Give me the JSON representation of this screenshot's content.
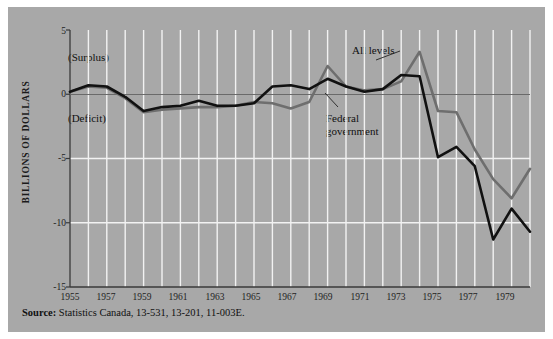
{
  "figure": {
    "background_color": "#a8a8a8",
    "page_color": "#ffffff",
    "source_prefix": "Source:",
    "source_text": "Statistics Canada, 13-531, 13-201, 11-003E."
  },
  "annotations": {
    "surplus": "(Surplus)",
    "deficit": "(Deficit)",
    "all_levels": "All levels",
    "federal_line1": "Federal",
    "federal_line2": "government"
  },
  "chart_data": {
    "type": "line",
    "title": "",
    "xlabel": "",
    "ylabel": "BILLIONS OF DOLLARS",
    "ylim": [
      -15,
      5
    ],
    "xlim": [
      1955,
      1980
    ],
    "yticks": [
      5,
      0,
      -5,
      -10,
      -15
    ],
    "ytick_labels": [
      "5",
      "0",
      "-5",
      "-10",
      "-15"
    ],
    "xticks": [
      1955,
      1957,
      1959,
      1961,
      1963,
      1965,
      1967,
      1969,
      1971,
      1973,
      1975,
      1977,
      1979
    ],
    "xtick_labels": [
      "1955",
      "1957",
      "1959",
      "1961",
      "1963",
      "1965",
      "1967",
      "1969",
      "1971",
      "1973",
      "1975",
      "1977",
      "1979"
    ],
    "grid": "vertical-every-year plus horizontal at -5 and -10",
    "zero_line": true,
    "legend_position": "inline-annotations",
    "x": [
      1955,
      1956,
      1957,
      1958,
      1959,
      1960,
      1961,
      1962,
      1963,
      1964,
      1965,
      1966,
      1967,
      1968,
      1969,
      1970,
      1971,
      1972,
      1973,
      1974,
      1975,
      1976,
      1977,
      1978,
      1979,
      1980
    ],
    "series": [
      {
        "name": "All levels",
        "color": "#6e6e6e",
        "values": [
          0.2,
          0.6,
          0.5,
          -0.3,
          -1.4,
          -1.2,
          -1.1,
          -1.0,
          -1.0,
          -0.9,
          -0.6,
          -0.7,
          -1.1,
          -0.6,
          2.2,
          0.6,
          0.3,
          0.4,
          1.0,
          3.3,
          -1.3,
          -1.4,
          -4.3,
          -6.6,
          -8.1,
          -5.8
        ]
      },
      {
        "name": "Federal government",
        "color": "#111111",
        "values": [
          0.2,
          0.7,
          0.6,
          -0.2,
          -1.3,
          -1.0,
          -0.9,
          -0.5,
          -0.9,
          -0.9,
          -0.7,
          0.6,
          0.7,
          0.4,
          1.2,
          0.6,
          0.2,
          0.4,
          1.5,
          1.4,
          -4.9,
          -4.1,
          -5.6,
          -11.3,
          -8.9,
          -10.7
        ]
      }
    ]
  }
}
